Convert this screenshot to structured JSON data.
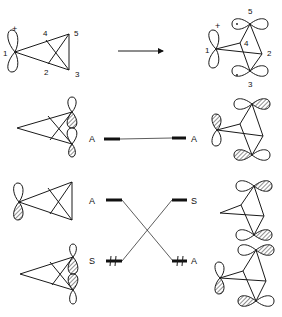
{
  "reaction_arrow": "right-arrow",
  "reactant": {
    "charge": "+",
    "atom_labels": [
      "1",
      "2",
      "3",
      "4",
      "5"
    ]
  },
  "product": {
    "charge": "+",
    "atom_labels": [
      "1",
      "2",
      "3",
      "4",
      "5"
    ],
    "radical_dot": "·"
  },
  "levels": {
    "top": {
      "left_label": "A",
      "right_label": "A"
    },
    "middle": {
      "left_label": "A",
      "right_label": "S"
    },
    "bottom": {
      "left_label": "S",
      "right_label": "A",
      "electrons": "paired"
    }
  }
}
